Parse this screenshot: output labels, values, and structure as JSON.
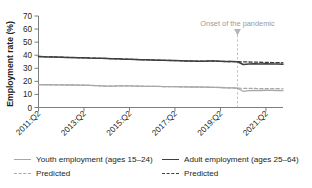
{
  "chart_data": {
    "type": "line",
    "title": "",
    "xlabel": "",
    "ylabel": "Employment rate (%)",
    "ylim": [
      0,
      70
    ],
    "yticks": [
      0,
      10,
      20,
      30,
      40,
      50,
      60,
      70
    ],
    "grid": false,
    "legend_position": "bottom",
    "x_tick_labels": [
      "2011:Q2",
      "2013:Q2",
      "2015:Q2",
      "2017:Q2",
      "2019:Q2",
      "2021:Q2"
    ],
    "x_tick_quarters": [
      0,
      8,
      16,
      24,
      32,
      40
    ],
    "x_range_quarters": [
      0,
      43
    ],
    "annotations": [
      {
        "text": "Onset of the pandemic",
        "x_quarter": 35,
        "x_label": "2020:Q1",
        "marker": "down-arrow",
        "line_style": "dashed"
      }
    ],
    "series": [
      {
        "name": "Adult employment (ages 25–64)",
        "style": "solid",
        "color": "#3f3f3f",
        "values": [
          39.0,
          38.8,
          38.7,
          38.6,
          38.5,
          38.3,
          38.2,
          38.1,
          38.0,
          37.8,
          37.7,
          37.6,
          37.5,
          37.3,
          37.2,
          37.0,
          36.9,
          36.8,
          36.6,
          36.5,
          36.4,
          36.2,
          36.1,
          36.0,
          35.9,
          35.8,
          35.6,
          35.5,
          35.4,
          35.4,
          35.6,
          35.5,
          35.3,
          35.1,
          35.2,
          35.0,
          32.9,
          33.3,
          33.4,
          33.3,
          33.4,
          33.3,
          33.2,
          33.1
        ]
      },
      {
        "name": "Adult employment predicted",
        "style": "dashed",
        "color": "#3f3f3f",
        "values": [
          39.0,
          38.8,
          38.7,
          38.6,
          38.5,
          38.3,
          38.2,
          38.1,
          38.0,
          37.8,
          37.7,
          37.6,
          37.5,
          37.3,
          37.2,
          37.0,
          36.9,
          36.8,
          36.6,
          36.5,
          36.4,
          36.2,
          36.1,
          36.0,
          35.9,
          35.8,
          35.6,
          35.5,
          35.4,
          35.4,
          35.6,
          35.5,
          35.3,
          35.1,
          35.2,
          35.0,
          34.9,
          34.8,
          34.7,
          34.6,
          34.5,
          34.4,
          34.3,
          34.2
        ]
      },
      {
        "name": "Youth employment (ages 15–24)",
        "style": "solid",
        "color": "#a8a8a8",
        "values": [
          17.5,
          17.4,
          17.4,
          17.3,
          17.3,
          17.2,
          17.2,
          17.1,
          17.1,
          17.0,
          16.8,
          16.6,
          16.4,
          16.3,
          16.5,
          16.6,
          16.5,
          16.4,
          16.3,
          16.2,
          16.2,
          16.1,
          16.0,
          16.0,
          15.9,
          15.8,
          15.8,
          15.7,
          15.7,
          15.6,
          15.5,
          15.4,
          15.3,
          15.1,
          15.0,
          14.8,
          12.4,
          12.9,
          13.1,
          13.0,
          13.2,
          13.1,
          13.0,
          12.9
        ]
      },
      {
        "name": "Youth employment predicted",
        "style": "dashed",
        "color": "#a8a8a8",
        "values": [
          17.5,
          17.4,
          17.4,
          17.3,
          17.3,
          17.2,
          17.2,
          17.1,
          17.1,
          17.0,
          16.8,
          16.6,
          16.4,
          16.3,
          16.5,
          16.6,
          16.5,
          16.4,
          16.3,
          16.2,
          16.2,
          16.1,
          16.0,
          16.0,
          15.9,
          15.8,
          15.8,
          15.7,
          15.7,
          15.6,
          15.5,
          15.4,
          15.3,
          15.1,
          15.0,
          14.8,
          14.7,
          14.6,
          14.6,
          14.5,
          14.5,
          14.4,
          14.4,
          14.3
        ]
      }
    ]
  },
  "legend": {
    "youth_solid_label": "Youth employment (ages 15–24)",
    "youth_dash_label": "Predicted",
    "adult_solid_label": "Adult employment (ages 25–64)",
    "adult_dash_label": "Predicted"
  },
  "axis": {
    "y_title": "Employment rate (%)"
  }
}
